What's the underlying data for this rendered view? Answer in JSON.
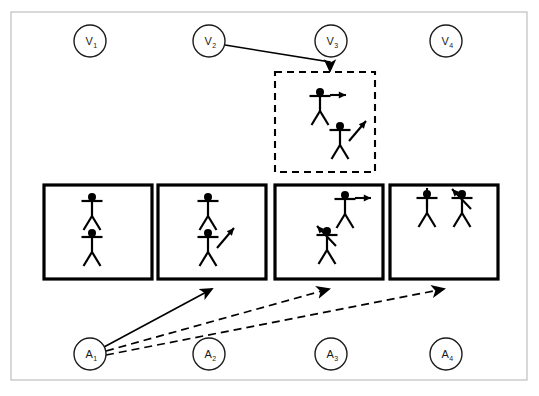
{
  "figure": {
    "background_color": "#ffffff",
    "ink_color": "#000000",
    "frame_color": "#b9b9b9"
  },
  "view_nodes": [
    {
      "id": "v1",
      "base": "V",
      "sub": "1",
      "label": "V1",
      "cx": 90,
      "cy": 41,
      "r": 16
    },
    {
      "id": "v2",
      "base": "V",
      "sub": "2",
      "label": "V2",
      "cx": 209,
      "cy": 41,
      "r": 16
    },
    {
      "id": "v3",
      "base": "V",
      "sub": "3",
      "label": "V3",
      "cx": 331,
      "cy": 41,
      "r": 16
    },
    {
      "id": "v4",
      "base": "V",
      "sub": "4",
      "label": "V4",
      "cx": 446,
      "cy": 41,
      "r": 16
    }
  ],
  "action_nodes": [
    {
      "id": "a1",
      "base": "A",
      "sub": "1",
      "label": "A1",
      "cx": 90,
      "cy": 354,
      "r": 16
    },
    {
      "id": "a2",
      "base": "A",
      "sub": "2",
      "label": "A2",
      "cx": 209,
      "cy": 354,
      "r": 16
    },
    {
      "id": "a3",
      "base": "A",
      "sub": "3",
      "label": "A3",
      "cx": 331,
      "cy": 354,
      "r": 16
    },
    {
      "id": "a4",
      "base": "A",
      "sub": "4",
      "label": "A4",
      "cx": 446,
      "cy": 354,
      "r": 16
    }
  ],
  "dashed_box": {
    "id": "dashed-state-box",
    "x": 275,
    "y": 72,
    "w": 100,
    "h": 100,
    "style": "dashed",
    "figures": [
      {
        "id": "d-fig-1",
        "x": 320,
        "y": 88,
        "scale": 1.0,
        "arrow": "right"
      },
      {
        "id": "d-fig-2",
        "x": 340,
        "y": 122,
        "scale": 1.0,
        "arrow": "up-right"
      }
    ]
  },
  "state_boxes": [
    {
      "id": "state-box-1",
      "x": 44,
      "y": 185,
      "w": 108,
      "h": 94,
      "figures": [
        {
          "id": "b1-fig-1",
          "x": 92,
          "y": 193,
          "arrow": "none"
        },
        {
          "id": "b1-fig-2",
          "x": 92,
          "y": 229,
          "arrow": "none"
        }
      ]
    },
    {
      "id": "state-box-2",
      "x": 158,
      "y": 185,
      "w": 108,
      "h": 94,
      "figures": [
        {
          "id": "b2-fig-1",
          "x": 208,
          "y": 193,
          "arrow": "none"
        },
        {
          "id": "b2-fig-2",
          "x": 208,
          "y": 229,
          "arrow": "up-right"
        }
      ]
    },
    {
      "id": "state-box-3",
      "x": 275,
      "y": 185,
      "w": 108,
      "h": 94,
      "figures": [
        {
          "id": "b3-fig-1",
          "x": 345,
          "y": 191,
          "arrow": "right"
        },
        {
          "id": "b3-fig-2",
          "x": 327,
          "y": 227,
          "arrow": "up-left"
        }
      ]
    },
    {
      "id": "state-box-4",
      "x": 390,
      "y": 185,
      "w": 108,
      "h": 94,
      "figures": [
        {
          "id": "b4-fig-1",
          "x": 427,
          "y": 190,
          "arrow": "up"
        },
        {
          "id": "b4-fig-2",
          "x": 462,
          "y": 190,
          "arrow": "up-left"
        }
      ]
    }
  ],
  "edges": [
    {
      "id": "edge-v2-dashedbox",
      "from": "v2",
      "to": "dashed-state-box",
      "style": "solid",
      "arrowhead": true,
      "points": "225,45 330,62 330,71"
    },
    {
      "id": "edge-a1-box2",
      "from": "a1",
      "to": "state-box-2",
      "style": "solid",
      "arrowhead": true,
      "points": "104,347 212,289"
    },
    {
      "id": "edge-a1-box3",
      "from": "a1",
      "to": "state-box-3",
      "style": "dashed",
      "arrowhead": true,
      "points": "106,351 329,289"
    },
    {
      "id": "edge-a1-box4",
      "from": "a1",
      "to": "state-box-4",
      "style": "dashed",
      "arrowhead": true,
      "points": "106,355 444,289"
    }
  ],
  "outer_frame": {
    "x": 11,
    "y": 12,
    "w": 516,
    "h": 368
  }
}
